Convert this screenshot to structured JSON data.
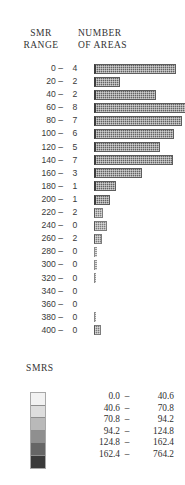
{
  "chart_data": {
    "type": "bar",
    "title": "",
    "xlabel": "NUMBER OF AREAS",
    "ylabel": "SMR RANGE",
    "orientation": "horizontal",
    "grid": false,
    "legend_position": "bottom",
    "categories": [
      "0 –",
      "20 –",
      "40 –",
      "60 –",
      "80 –",
      "100 –",
      "120 –",
      "140 –",
      "160 –",
      "180 –",
      "200 –",
      "220 –",
      "240 –",
      "260 –",
      "280 –",
      "300 –",
      "320 –",
      "340 –",
      "360 –",
      "380 –",
      "400 –"
    ],
    "values": [
      4,
      2,
      2,
      8,
      7,
      6,
      5,
      7,
      3,
      1,
      1,
      2,
      0,
      2,
      0,
      0,
      0,
      0,
      0,
      0,
      0
    ],
    "xlim": [
      0,
      8
    ],
    "bar_pixel_widths": [
      82,
      26,
      62,
      115,
      88,
      80,
      66,
      79,
      48,
      22,
      16,
      9,
      13,
      8,
      3,
      3,
      2,
      0,
      0,
      2,
      7
    ],
    "legend_label": "SMRS",
    "legend_entries": [
      {
        "lo": "0.0",
        "hi": "40.6",
        "dash": "–",
        "color": "#f2f2f2"
      },
      {
        "lo": "40.6",
        "hi": "70.8",
        "dash": "–",
        "color": "#dddddd"
      },
      {
        "lo": "70.8",
        "hi": "94.2",
        "dash": "–",
        "color": "#b9b9b9"
      },
      {
        "lo": "94.2",
        "hi": "124.8",
        "dash": "–",
        "color": "#8f8f8f"
      },
      {
        "lo": "124.8",
        "hi": "162.4",
        "dash": "–",
        "color": "#666666"
      },
      {
        "lo": "162.4",
        "hi": "764.2",
        "dash": "–",
        "color": "#3a3a3a"
      }
    ]
  },
  "headers": {
    "left_line1": "SMR",
    "left_line2": "RANGE",
    "right_line1": "NUMBER",
    "right_line2": "OF AREAS"
  },
  "rows": [
    {
      "range": "0 –",
      "count": "4",
      "w": 82,
      "style": "bar"
    },
    {
      "range": "20 –",
      "count": "2",
      "w": 26,
      "style": "bar"
    },
    {
      "range": "40 –",
      "count": "2",
      "w": 62,
      "style": "bar"
    },
    {
      "range": "60 –",
      "count": "8",
      "w": 115,
      "style": "bar"
    },
    {
      "range": "80 –",
      "count": "7",
      "w": 88,
      "style": "bar"
    },
    {
      "range": "100 –",
      "count": "6",
      "w": 80,
      "style": "bar"
    },
    {
      "range": "120 –",
      "count": "5",
      "w": 66,
      "style": "bar"
    },
    {
      "range": "140 –",
      "count": "7",
      "w": 79,
      "style": "bar"
    },
    {
      "range": "160 –",
      "count": "3",
      "w": 48,
      "style": "bar"
    },
    {
      "range": "180 –",
      "count": "1",
      "w": 22,
      "style": "bar"
    },
    {
      "range": "200 –",
      "count": "1",
      "w": 16,
      "style": "bar"
    },
    {
      "range": "220 –",
      "count": "2",
      "w": 9,
      "style": "tiny"
    },
    {
      "range": "240 –",
      "count": "0",
      "w": 13,
      "style": "tiny"
    },
    {
      "range": "260 –",
      "count": "2",
      "w": 8,
      "style": "tiny"
    },
    {
      "range": "280 –",
      "count": "0",
      "w": 3,
      "style": "hair"
    },
    {
      "range": "300 –",
      "count": "0",
      "w": 3,
      "style": "hair"
    },
    {
      "range": "320 –",
      "count": "0",
      "w": 2,
      "style": "hair"
    },
    {
      "range": "340 –",
      "count": "0",
      "w": 0,
      "style": "none"
    },
    {
      "range": "360 –",
      "count": "0",
      "w": 0,
      "style": "none"
    },
    {
      "range": "380 –",
      "count": "0",
      "w": 2,
      "style": "hair"
    },
    {
      "range": "400 –",
      "count": "0",
      "w": 7,
      "style": "tiny"
    }
  ],
  "legend": {
    "title": "SMRS"
  }
}
